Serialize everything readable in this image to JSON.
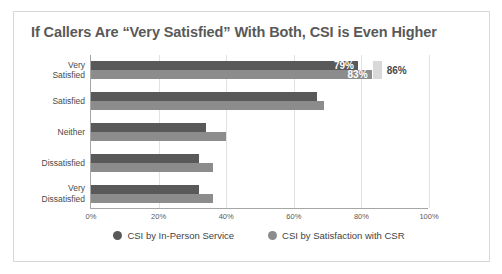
{
  "chart_data": {
    "type": "bar",
    "orientation": "horizontal",
    "title": "If Callers Are “Very Satisfied” With Both, CSI is Even Higher",
    "xlabel": "",
    "ylabel": "",
    "xlim": [
      0,
      100
    ],
    "xticks": [
      "0%",
      "20%",
      "40%",
      "60%",
      "80%",
      "100%"
    ],
    "xtick_values": [
      0,
      20,
      40,
      60,
      80,
      100
    ],
    "grid": true,
    "legend_position": "bottom",
    "categories": [
      "Very Satisfied",
      "Satisfied",
      "Neither",
      "Dissatisfied",
      "Very Dissatisfied"
    ],
    "category_lines": [
      [
        "Very",
        "Satisfied"
      ],
      [
        "Satisfied"
      ],
      [
        "Neither"
      ],
      [
        "Dissatisfied"
      ],
      [
        "Very",
        "Dissatisfied"
      ]
    ],
    "series": [
      {
        "name": "CSI by In-Person Service",
        "color": "#595959",
        "values": [
          79,
          67,
          34,
          32,
          32
        ],
        "labels": [
          "79%",
          "",
          "",
          "",
          ""
        ]
      },
      {
        "name": "CSI by Satisfaction with CSR",
        "color": "#8c8c8c",
        "values": [
          83,
          69,
          40,
          36,
          36
        ],
        "labels": [
          "83%",
          "",
          "",
          "",
          ""
        ]
      }
    ],
    "annotations": [
      {
        "name": "combined-marker",
        "label": "86%",
        "value": 86,
        "category": "Very Satisfied",
        "color": "#d9d9d9"
      }
    ]
  }
}
